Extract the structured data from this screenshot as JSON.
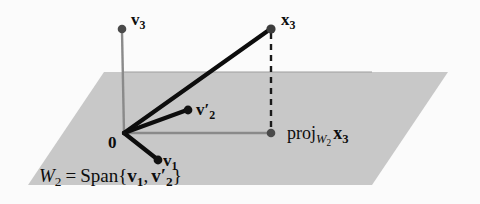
{
  "figure": {
    "background_color": "#fbfbfb",
    "plane_fill_color": "#c8c8c8",
    "vector_color": "#0d0d0d",
    "axis_line_color": "#8a8a8a",
    "dashed_line_color": "#1a1a1a"
  },
  "labels": {
    "v3": {
      "name": "v",
      "sub": "3",
      "prime": ""
    },
    "x3": {
      "name": "x",
      "sub": "3",
      "prime": ""
    },
    "v2prime": {
      "name": "v",
      "sub": "2",
      "prime": "′"
    },
    "v1": {
      "name": "v",
      "sub": "1",
      "prime": ""
    },
    "origin": "0",
    "projection": {
      "operator": "proj",
      "subspace_name": "W",
      "subspace_sub": "2",
      "vector_name": "x",
      "vector_sub": "3",
      "full_text": "proj_{W2} x3"
    },
    "span_caption": {
      "subspace_name": "W",
      "subspace_sub": "2",
      "equals": "=",
      "operator": "Span",
      "open_brace": "{",
      "first_vector": "v",
      "first_sub": "1",
      "comma": ",",
      "second_vector": "v",
      "second_sub": "2",
      "second_prime": "′",
      "close_brace": "}",
      "full_text": "W2 = Span{v1, v2′}"
    }
  },
  "geometry": {
    "origin_point": [
      124,
      133
    ],
    "v3_point": [
      122,
      29
    ],
    "x3_point": [
      271,
      29
    ],
    "v2prime_point": [
      188,
      110
    ],
    "v1_point": [
      158,
      160
    ],
    "projection_point": [
      271,
      133
    ],
    "plane_corners": [
      [
        104,
        72
      ],
      [
        448,
        72
      ],
      [
        372,
        185
      ],
      [
        28,
        185
      ]
    ]
  }
}
